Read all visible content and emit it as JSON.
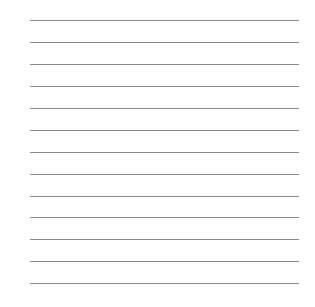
{
  "page": {
    "type": "lined-paper",
    "background_color": "#fefefe",
    "rule_color": "#8c8c8c",
    "rule_count": 13,
    "rules_y": [
      20,
      42,
      64,
      86,
      108,
      130,
      152,
      174,
      196,
      217,
      239,
      261,
      283
    ],
    "rule_left": 30,
    "rule_right": 299
  }
}
